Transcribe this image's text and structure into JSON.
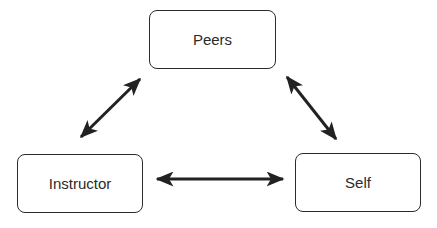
{
  "diagram": {
    "nodes": [
      {
        "id": "peers",
        "label": "Peers"
      },
      {
        "id": "instructor",
        "label": "Instructor"
      },
      {
        "id": "self",
        "label": "Self"
      }
    ],
    "edges": [
      {
        "from": "instructor",
        "to": "peers",
        "direction": "bidirectional"
      },
      {
        "from": "peers",
        "to": "self",
        "direction": "bidirectional"
      },
      {
        "from": "instructor",
        "to": "self",
        "direction": "bidirectional"
      }
    ],
    "colors": {
      "stroke": "#222222",
      "text": "#2a2a2a",
      "background": "#ffffff"
    }
  }
}
